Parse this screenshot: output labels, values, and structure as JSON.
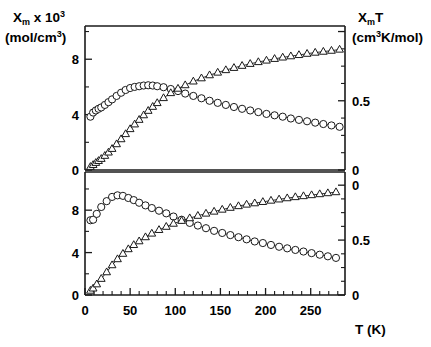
{
  "chart_data": {
    "type": "scatter",
    "title": "",
    "xlabel": "T (K)",
    "ylabel_left_line1": "X",
    "ylabel_left_line1_sub": "m",
    "ylabel_left_line1_rest": " x 10",
    "ylabel_left_line1_sup": "3",
    "ylabel_left_line2a": "(mol/cm",
    "ylabel_left_line2_sup": "3",
    "ylabel_left_line2b": ")",
    "ylabel_right_line1": "X",
    "ylabel_right_line1_sub": "m",
    "ylabel_right_line1_rest": "T",
    "ylabel_right_line2a": "(cm",
    "ylabel_right_line2_sup": "3",
    "ylabel_right_line2b": "K/mol)",
    "xlim": [
      0,
      288
    ],
    "xticks_major": [
      0,
      50,
      100,
      150,
      200,
      250
    ],
    "xticks_major_labels": [
      "0",
      "50",
      "100",
      "150",
      "200",
      "250"
    ],
    "xticks_minor_step": 10,
    "grid": false,
    "legend": "none",
    "panels": [
      {
        "name": "top-panel",
        "ylim_left": [
          0,
          10.4
        ],
        "yticks_left": [
          0,
          4,
          8
        ],
        "yticks_left_labels": [
          "0",
          "4",
          "8"
        ],
        "yticks_left_minor": [
          2,
          6,
          10
        ],
        "ylim_right": [
          0,
          1.04
        ],
        "yticks_right": [
          0,
          0.5,
          1.0
        ],
        "yticks_right_labels": [
          "0",
          "0.5",
          ""
        ],
        "yticks_right_minor": [
          0.125,
          0.25,
          0.375,
          0.625,
          0.75,
          0.875
        ],
        "series": [
          {
            "name": "chi-m-top",
            "marker": "circle",
            "axis": "left",
            "x": [
              6,
              9,
              12,
              15,
              18,
              22,
              26,
              30,
              35,
              40,
              45,
              50,
              55,
              60,
              65,
              70,
              75,
              80,
              87,
              95,
              103,
              111,
              120,
              129,
              138,
              147,
              156,
              165,
              174,
              183,
              192,
              201,
              210,
              219,
              228,
              237,
              246,
              255,
              264,
              273,
              282
            ],
            "y": [
              3.85,
              4.15,
              4.3,
              4.42,
              4.52,
              4.7,
              4.9,
              5.1,
              5.35,
              5.58,
              5.78,
              5.92,
              6.0,
              6.05,
              6.1,
              6.12,
              6.1,
              6.05,
              5.98,
              5.85,
              5.7,
              5.52,
              5.35,
              5.18,
              5.0,
              4.85,
              4.7,
              4.55,
              4.42,
              4.3,
              4.18,
              4.05,
              3.95,
              3.85,
              3.72,
              3.62,
              3.52,
              3.42,
              3.32,
              3.22,
              3.12
            ]
          },
          {
            "name": "chi-m-t-top",
            "marker": "triangle",
            "axis": "right",
            "x": [
              6,
              9,
              12,
              15,
              18,
              22,
              26,
              30,
              35,
              40,
              45,
              50,
              55,
              60,
              65,
              70,
              75,
              80,
              87,
              95,
              103,
              111,
              120,
              129,
              138,
              147,
              156,
              165,
              174,
              183,
              192,
              201,
              210,
              219,
              228,
              237,
              246,
              255,
              264,
              273,
              282
            ],
            "y": [
              0.023,
              0.037,
              0.052,
              0.066,
              0.081,
              0.103,
              0.127,
              0.153,
              0.187,
              0.223,
              0.26,
              0.296,
              0.33,
              0.363,
              0.396,
              0.428,
              0.457,
              0.484,
              0.52,
              0.556,
              0.588,
              0.613,
              0.64,
              0.663,
              0.685,
              0.704,
              0.722,
              0.738,
              0.753,
              0.767,
              0.78,
              0.791,
              0.803,
              0.813,
              0.822,
              0.831,
              0.84,
              0.848,
              0.855,
              0.862,
              0.87
            ]
          }
        ]
      },
      {
        "name": "bottom-panel",
        "ylim_left": [
          0,
          11.6
        ],
        "yticks_left": [
          0,
          4,
          8
        ],
        "yticks_left_labels": [
          "0",
          "4",
          "8"
        ],
        "yticks_left_minor": [
          2,
          6,
          10
        ],
        "ylim_right": [
          0,
          1.12
        ],
        "yticks_right": [
          0,
          0.5,
          1.0
        ],
        "yticks_right_labels": [
          "0",
          "0.5",
          "0"
        ],
        "yticks_right_minor": [
          0.125,
          0.25,
          0.375,
          0.625,
          0.75,
          0.875
        ],
        "series": [
          {
            "name": "chi-m-bottom",
            "marker": "circle",
            "axis": "left",
            "x": [
              6,
              9,
              13,
              18,
              24,
              30,
              36,
              42,
              48,
              54,
              60,
              67,
              74,
              82,
              90,
              98,
              107,
              116,
              125,
              134,
              143,
              152,
              161,
              170,
              179,
              188,
              197,
              206,
              215,
              224,
              233,
              242,
              251,
              260,
              269,
              278
            ],
            "y": [
              7.05,
              7.1,
              7.65,
              8.3,
              8.85,
              9.25,
              9.4,
              9.35,
              9.15,
              8.95,
              8.7,
              8.45,
              8.2,
              7.95,
              7.7,
              7.4,
              7.1,
              6.8,
              6.55,
              6.3,
              6.05,
              5.85,
              5.65,
              5.45,
              5.25,
              5.05,
              4.9,
              4.72,
              4.55,
              4.4,
              4.25,
              4.1,
              3.95,
              3.8,
              3.65,
              3.5
            ]
          },
          {
            "name": "chi-m-t-bottom",
            "marker": "triangle",
            "axis": "right",
            "x": [
              6,
              9,
              13,
              18,
              24,
              30,
              36,
              42,
              48,
              54,
              60,
              67,
              74,
              82,
              90,
              98,
              107,
              116,
              125,
              134,
              143,
              152,
              161,
              170,
              179,
              188,
              197,
              206,
              215,
              224,
              233,
              242,
              251,
              260,
              269,
              278
            ],
            "y": [
              0.04,
              0.06,
              0.098,
              0.148,
              0.208,
              0.272,
              0.327,
              0.376,
              0.418,
              0.456,
              0.49,
              0.527,
              0.56,
              0.593,
              0.622,
              0.65,
              0.676,
              0.7,
              0.722,
              0.742,
              0.76,
              0.778,
              0.795,
              0.81,
              0.824,
              0.836,
              0.848,
              0.86,
              0.871,
              0.882,
              0.892,
              0.901,
              0.91,
              0.919,
              0.928,
              0.937
            ]
          }
        ]
      }
    ]
  },
  "figure": {
    "xaxis_label": "T (K)",
    "xtick_labels": [
      "0",
      "50",
      "100",
      "150",
      "200",
      "250"
    ],
    "left_ytick_labels_top": [
      "8",
      "4",
      "0"
    ],
    "left_ytick_labels_bottom": [
      "8",
      "4",
      "0"
    ],
    "right_ytick_labels_top": [
      "0.5",
      "0"
    ],
    "right_ytick_labels_bottom": [
      "0.5",
      "0"
    ],
    "right_ytick_top_zero": "0"
  }
}
